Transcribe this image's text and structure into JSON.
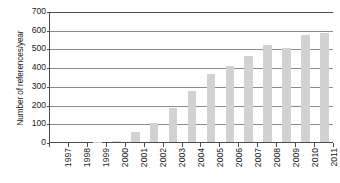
{
  "chart_data": {
    "type": "bar",
    "title": "",
    "xlabel": "",
    "ylabel": "Number of references/year",
    "categories": [
      "1997",
      "1998",
      "1999",
      "2000",
      "2001",
      "2002",
      "2003",
      "2004",
      "2005",
      "2006",
      "2007",
      "2008",
      "2009",
      "2010",
      "2011"
    ],
    "values": [
      0,
      0,
      1,
      5,
      55,
      100,
      180,
      275,
      365,
      405,
      460,
      520,
      500,
      570,
      585
    ],
    "ylim": [
      0,
      700
    ],
    "yticks": [
      0,
      100,
      200,
      300,
      400,
      500,
      600,
      700
    ],
    "ytick_labels": [
      "0",
      "100",
      "200",
      "300",
      "400",
      "500",
      "600",
      "700"
    ],
    "grid": true,
    "legend": false,
    "bar_color": "#d2d2d2",
    "axis_color": "#4d4d4d",
    "gridline_color": "#8c8c8c"
  }
}
